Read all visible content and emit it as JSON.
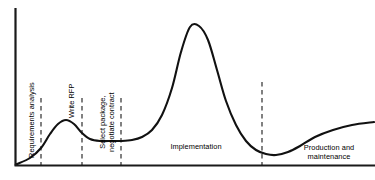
{
  "figure": {
    "background_color": "#ffffff",
    "line_color": "#111111",
    "axis_color": "#1a1a1a"
  },
  "labels": {
    "requirements_analysis": "Requirements analysis",
    "write_rfp": "Write RFP",
    "select_package": "Select package,\nnegotiate contract",
    "implementation": "Implementation",
    "production_maintenance": "Production and\nmaintenance"
  },
  "chart_data": {
    "type": "line",
    "xlabel": "",
    "ylabel": "",
    "grid": false,
    "legend": null,
    "axes": {
      "y_axis_x": 15,
      "x_axis_y": 165,
      "x_range_px": [
        15,
        375
      ],
      "y_range_px": [
        8,
        165
      ]
    },
    "series": [
      {
        "name": "Effort",
        "points_px": [
          [
            17,
            164
          ],
          [
            30,
            158
          ],
          [
            41,
            148
          ],
          [
            50,
            134
          ],
          [
            58,
            124
          ],
          [
            66,
            120
          ],
          [
            74,
            124
          ],
          [
            82,
            133
          ],
          [
            90,
            139
          ],
          [
            100,
            141
          ],
          [
            112,
            141
          ],
          [
            121,
            141
          ],
          [
            132,
            140
          ],
          [
            142,
            137
          ],
          [
            152,
            130
          ],
          [
            162,
            115
          ],
          [
            172,
            88
          ],
          [
            181,
            52
          ],
          [
            190,
            27
          ],
          [
            199,
            26
          ],
          [
            208,
            40
          ],
          [
            217,
            70
          ],
          [
            226,
            101
          ],
          [
            236,
            125
          ],
          [
            246,
            141
          ],
          [
            256,
            150
          ],
          [
            266,
            154
          ],
          [
            276,
            155
          ],
          [
            288,
            152
          ],
          [
            300,
            146
          ],
          [
            315,
            137
          ],
          [
            333,
            130
          ],
          [
            352,
            125
          ],
          [
            374,
            122
          ]
        ]
      }
    ],
    "phase_dividers_px": [
      {
        "x": 41,
        "y_top": 98,
        "label": "requirements-analysis-boundary"
      },
      {
        "x": 82,
        "y_top": 98,
        "label": "write-rfp-boundary"
      },
      {
        "x": 121,
        "y_top": 98,
        "label": "select-package-boundary"
      },
      {
        "x": 262,
        "y_top": 82,
        "label": "implementation-boundary"
      }
    ],
    "annotations": [
      {
        "text": "Requirements analysis",
        "x_px": 28,
        "y_px": 155,
        "orientation": "vertical"
      },
      {
        "text": "Write RFP",
        "x_px": 68,
        "y_px": 155,
        "orientation": "vertical"
      },
      {
        "text": "Select package, negotiate contract",
        "x_px": 104,
        "y_px": 155,
        "orientation": "vertical"
      },
      {
        "text": "Implementation",
        "x_px": 196,
        "y_px": 148,
        "orientation": "horizontal"
      },
      {
        "text": "Production and maintenance",
        "x_px": 330,
        "y_px": 155,
        "orientation": "horizontal"
      }
    ]
  }
}
